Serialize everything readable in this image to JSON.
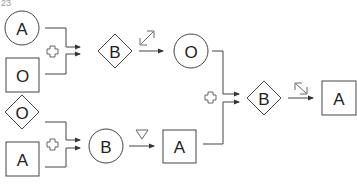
{
  "question_number": "23",
  "colors": {
    "stroke": "#444444",
    "text": "#222222",
    "background": "#ffffff"
  },
  "group1": {
    "input_top": {
      "shape": "circle",
      "label": "A"
    },
    "input_bottom": {
      "shape": "square",
      "label": "O"
    },
    "operator_icon": "plus-outline-icon",
    "result": {
      "shape": "diamond",
      "label": "B"
    },
    "transform_icon": "diagonal-double-arrow-icon",
    "output": {
      "shape": "circle",
      "label": "O"
    }
  },
  "group2": {
    "input_top": {
      "shape": "diamond",
      "label": "O"
    },
    "input_bottom": {
      "shape": "square",
      "label": "A"
    },
    "operator_icon": "plus-outline-icon",
    "result": {
      "shape": "circle",
      "label": "B"
    },
    "transform_icon": "down-triangle-icon",
    "output": {
      "shape": "square",
      "label": "A"
    }
  },
  "final": {
    "operator_icon": "plus-outline-icon",
    "result": {
      "shape": "diamond",
      "label": "B"
    },
    "transform_icon": "diagonal-double-arrow-icon",
    "output": {
      "shape": "square",
      "label": "A"
    }
  }
}
